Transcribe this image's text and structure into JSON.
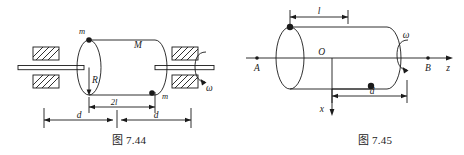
{
  "page": {
    "background_color": "#ffffff",
    "line_color": "#1a1a1a",
    "width": 464,
    "height": 155
  },
  "figures": [
    {
      "id": "fig-7-44",
      "caption": "图 7.44",
      "description": "Cylinder of mass M on a horizontal shaft supported by two hatched bearings, rotating with angular velocity omega; two point masses m attached at opposite ends of the cylinder surface.",
      "labels": {
        "mass_top": "m",
        "mass_bottom": "m",
        "cylinder_mass": "M",
        "radius": "R",
        "length": "2l",
        "distance_left": "d",
        "distance_right": "d",
        "angular_velocity": "ω"
      },
      "dimensions": [
        {
          "name": "cylinder-length",
          "label": "2l"
        },
        {
          "name": "left-span",
          "label": "d"
        },
        {
          "name": "right-span",
          "label": "d"
        }
      ],
      "supports": [
        {
          "name": "bearing-left-upper"
        },
        {
          "name": "bearing-left-lower"
        },
        {
          "name": "bearing-right-upper"
        },
        {
          "name": "bearing-right-lower"
        }
      ]
    },
    {
      "id": "fig-7-45",
      "caption": "图 7.45",
      "description": "Cylinder on the z axis between points A and B, rotating with angular velocity omega; point masses on the surface, origin O with x axis pointing down, axial offset l and distance d marked.",
      "labels": {
        "origin": "O",
        "axis_z": "z",
        "axis_x": "x",
        "point_a": "A",
        "point_b": "B",
        "offset": "l",
        "distance": "d",
        "angular_velocity": "ω"
      },
      "dimensions": [
        {
          "name": "offset-l",
          "label": "l"
        },
        {
          "name": "distance-d",
          "label": "d"
        }
      ]
    }
  ]
}
